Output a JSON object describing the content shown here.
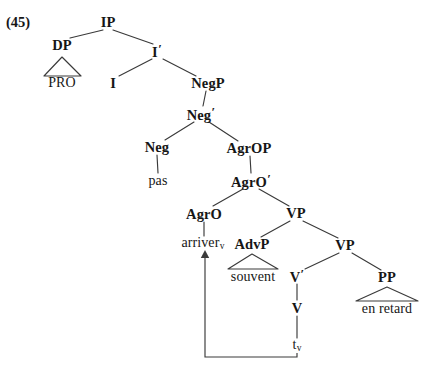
{
  "figure": {
    "example_number": "(45)",
    "kind": "syntactic-tree",
    "language_of_example": "French",
    "sentence_glossed": "PRO pas arriver souvent en retard"
  },
  "colors": {
    "ink": "#161616",
    "line": "#3a3a3a",
    "background": "#ffffff"
  },
  "nodes": {
    "ip": {
      "label": "IP",
      "x": 108,
      "y": 22
    },
    "dp": {
      "label": "DP",
      "x": 62,
      "y": 45
    },
    "pro": {
      "label": "PRO",
      "x": 62,
      "y": 83
    },
    "ibar": {
      "label": "I",
      "bar": "′",
      "x": 157,
      "y": 51
    },
    "i": {
      "label": "I",
      "x": 113,
      "y": 83
    },
    "negp": {
      "label": "NegP",
      "x": 208,
      "y": 83
    },
    "negbar": {
      "label": "Neg",
      "bar": "′",
      "x": 201,
      "y": 114
    },
    "neg": {
      "label": "Neg",
      "x": 157,
      "y": 147
    },
    "pas": {
      "label": "pas",
      "x": 158,
      "y": 181
    },
    "agrop": {
      "label": "AgrOP",
      "x": 249,
      "y": 148
    },
    "agrobar": {
      "label": "AgrO",
      "bar": "′",
      "x": 251,
      "y": 181
    },
    "agro": {
      "label": "AgrO",
      "x": 204,
      "y": 214
    },
    "arriver": {
      "label": "arriver",
      "sub": "v",
      "x": 203,
      "y": 244
    },
    "vp_upper": {
      "label": "VP",
      "x": 296,
      "y": 213
    },
    "advp": {
      "label": "AdvP",
      "x": 252,
      "y": 244
    },
    "souvent": {
      "label": "souvent",
      "x": 253,
      "y": 277
    },
    "vp_lower": {
      "label": "VP",
      "x": 345,
      "y": 245
    },
    "vbar": {
      "label": "V",
      "bar": "′",
      "x": 297,
      "y": 276
    },
    "v": {
      "label": "V",
      "x": 297,
      "y": 308
    },
    "trace": {
      "label": "t",
      "sub": "v",
      "x": 297,
      "y": 346
    },
    "pp": {
      "label": "PP",
      "x": 387,
      "y": 277
    },
    "en_retard": {
      "label": "en retard",
      "x": 387,
      "y": 309
    }
  },
  "triangles": [
    {
      "name": "dp-triangle",
      "apex_x": 62,
      "apex_y": 57,
      "left_x": 44,
      "right_x": 81,
      "base_y": 76
    },
    {
      "name": "advp-triangle",
      "apex_x": 252,
      "apex_y": 254,
      "left_x": 228,
      "right_x": 278,
      "base_y": 269
    },
    {
      "name": "pp-triangle",
      "apex_x": 387,
      "apex_y": 287,
      "left_x": 356,
      "right_x": 418,
      "base_y": 301
    }
  ],
  "branches": [
    {
      "name": "ip-to-dp",
      "x1": 103,
      "y1": 30,
      "x2": 70,
      "y2": 38
    },
    {
      "name": "ip-to-ibar",
      "x1": 113,
      "y1": 30,
      "x2": 153,
      "y2": 44
    },
    {
      "name": "ibar-to-i",
      "x1": 152,
      "y1": 59,
      "x2": 119,
      "y2": 76
    },
    {
      "name": "ibar-to-negp",
      "x1": 163,
      "y1": 59,
      "x2": 196,
      "y2": 76
    },
    {
      "name": "negp-to-negbar",
      "x1": 206,
      "y1": 91,
      "x2": 203,
      "y2": 106
    },
    {
      "name": "negbar-to-neg",
      "x1": 194,
      "y1": 122,
      "x2": 165,
      "y2": 140
    },
    {
      "name": "negbar-to-agrop",
      "x1": 209,
      "y1": 122,
      "x2": 238,
      "y2": 141
    },
    {
      "name": "neg-to-pas",
      "x1": 157,
      "y1": 155,
      "x2": 158,
      "y2": 173
    },
    {
      "name": "agrop-to-agrobar",
      "x1": 250,
      "y1": 156,
      "x2": 251,
      "y2": 173
    },
    {
      "name": "agrobar-to-agro",
      "x1": 243,
      "y1": 189,
      "x2": 213,
      "y2": 206
    },
    {
      "name": "agrobar-to-vp-upper",
      "x1": 259,
      "y1": 189,
      "x2": 289,
      "y2": 206
    },
    {
      "name": "agro-to-arriver",
      "x1": 204,
      "y1": 222,
      "x2": 204,
      "y2": 236
    },
    {
      "name": "vp-upper-to-advp",
      "x1": 290,
      "y1": 221,
      "x2": 261,
      "y2": 237
    },
    {
      "name": "vp-upper-to-vp-lower",
      "x1": 303,
      "y1": 221,
      "x2": 338,
      "y2": 238
    },
    {
      "name": "vp-lower-to-vbar",
      "x1": 339,
      "y1": 253,
      "x2": 305,
      "y2": 269
    },
    {
      "name": "vp-lower-to-pp",
      "x1": 352,
      "y1": 253,
      "x2": 381,
      "y2": 270
    },
    {
      "name": "vbar-to-v",
      "x1": 297,
      "y1": 284,
      "x2": 297,
      "y2": 300
    },
    {
      "name": "v-to-trace",
      "x1": 297,
      "y1": 316,
      "x2": 297,
      "y2": 338
    }
  ],
  "movement": {
    "name": "head-movement-arrow",
    "from": "t_v (V position)",
    "to": "arriver_v (AgrO position)",
    "path": [
      {
        "x": 297,
        "y": 353
      },
      {
        "x": 297,
        "y": 357
      },
      {
        "x": 205,
        "y": 357
      },
      {
        "x": 205,
        "y": 253
      }
    ],
    "arrowhead_x": 205,
    "arrowhead_y": 250
  }
}
